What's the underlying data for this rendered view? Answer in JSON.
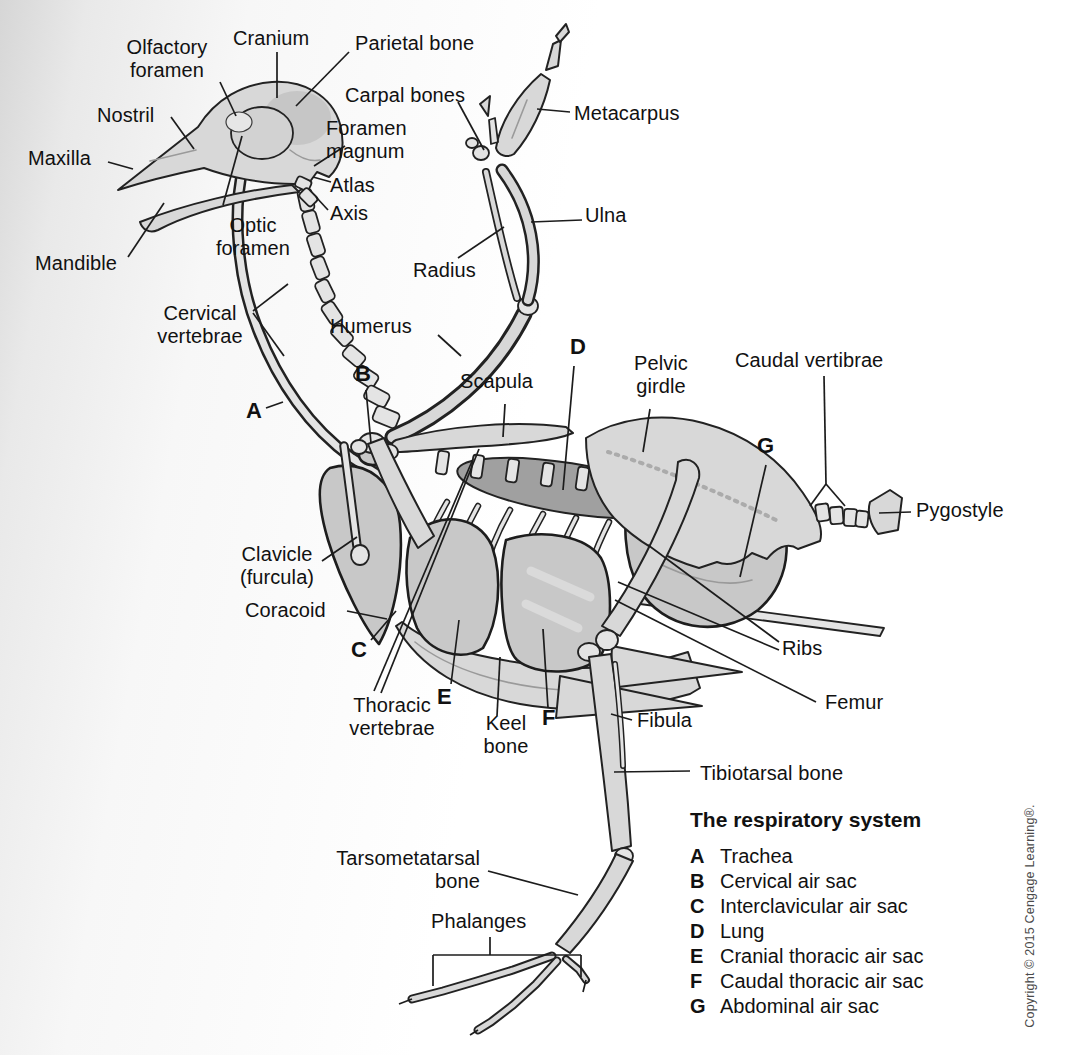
{
  "colors": {
    "background_left": "#d6d6d6",
    "paper": "#ffffff",
    "bone": "#d8d8d8",
    "bone_light": "#e4e4e4",
    "air_sac": "#c8c8c8",
    "lung": "#a0a0a0",
    "outline": "#222222",
    "text": "#111111",
    "copyright_text": "#4a4a4a"
  },
  "labels": [
    {
      "id": "olfactory-foramen",
      "text": "Olfactory\nforamen",
      "x": 167,
      "y": 36,
      "align": "center"
    },
    {
      "id": "cranium",
      "text": "Cranium",
      "x": 233,
      "y": 27,
      "align": "left"
    },
    {
      "id": "parietal-bone",
      "text": "Parietal bone",
      "x": 355,
      "y": 32,
      "align": "left"
    },
    {
      "id": "carpal-bones",
      "text": "Carpal bones",
      "x": 345,
      "y": 84,
      "align": "left"
    },
    {
      "id": "metacarpus",
      "text": "Metacarpus",
      "x": 574,
      "y": 102,
      "align": "left"
    },
    {
      "id": "nostril",
      "text": "Nostril",
      "x": 97,
      "y": 104,
      "align": "left"
    },
    {
      "id": "foramen-magnum",
      "text": "Foramen\nmagnum",
      "x": 326,
      "y": 117,
      "align": "left"
    },
    {
      "id": "maxilla",
      "text": "Maxilla",
      "x": 28,
      "y": 147,
      "align": "left"
    },
    {
      "id": "atlas",
      "text": "Atlas",
      "x": 330,
      "y": 174,
      "align": "left"
    },
    {
      "id": "axis",
      "text": "Axis",
      "x": 330,
      "y": 202,
      "align": "left"
    },
    {
      "id": "optic-foramen",
      "text": "Optic\nforamen",
      "x": 253,
      "y": 214,
      "align": "center"
    },
    {
      "id": "mandible",
      "text": "Mandible",
      "x": 35,
      "y": 252,
      "align": "left"
    },
    {
      "id": "ulna",
      "text": "Ulna",
      "x": 585,
      "y": 204,
      "align": "left"
    },
    {
      "id": "radius",
      "text": "Radius",
      "x": 413,
      "y": 259,
      "align": "left"
    },
    {
      "id": "cervical-vertebrae",
      "text": "Cervical\nvertebrae",
      "x": 200,
      "y": 302,
      "align": "center"
    },
    {
      "id": "humerus",
      "text": "Humerus",
      "x": 330,
      "y": 315,
      "align": "left"
    },
    {
      "id": "scapula",
      "text": "Scapula",
      "x": 460,
      "y": 370,
      "align": "left"
    },
    {
      "id": "pelvic-girdle",
      "text": "Pelvic\ngirdle",
      "x": 661,
      "y": 352,
      "align": "center"
    },
    {
      "id": "caudal-vertibrae",
      "text": "Caudal vertibrae",
      "x": 735,
      "y": 349,
      "align": "left"
    },
    {
      "id": "pygostyle",
      "text": "Pygostyle",
      "x": 916,
      "y": 499,
      "align": "left"
    },
    {
      "id": "clavicle-furcula",
      "text": "Clavicle\n(furcula)",
      "x": 277,
      "y": 543,
      "align": "center"
    },
    {
      "id": "coracoid",
      "text": "Coracoid",
      "x": 245,
      "y": 599,
      "align": "left"
    },
    {
      "id": "thoracic-vertebrae",
      "text": "Thoracic\nvertebrae",
      "x": 392,
      "y": 694,
      "align": "center"
    },
    {
      "id": "keel-bone",
      "text": "Keel\nbone",
      "x": 506,
      "y": 712,
      "align": "center"
    },
    {
      "id": "ribs",
      "text": "Ribs",
      "x": 782,
      "y": 637,
      "align": "left"
    },
    {
      "id": "femur",
      "text": "Femur",
      "x": 825,
      "y": 691,
      "align": "left"
    },
    {
      "id": "fibula",
      "text": "Fibula",
      "x": 637,
      "y": 709,
      "align": "left"
    },
    {
      "id": "tibiotarsal-bone",
      "text": "Tibiotarsal bone",
      "x": 700,
      "y": 762,
      "align": "left"
    },
    {
      "id": "tarsometatarsal-bone",
      "text": "Tarsometatarsal\nbone",
      "x": 480,
      "y": 847,
      "align": "right"
    },
    {
      "id": "phalanges",
      "text": "Phalanges",
      "x": 431,
      "y": 910,
      "align": "left"
    }
  ],
  "markers": [
    {
      "letter": "A",
      "x": 246,
      "y": 400
    },
    {
      "letter": "B",
      "x": 355,
      "y": 363
    },
    {
      "letter": "C",
      "x": 351,
      "y": 639
    },
    {
      "letter": "D",
      "x": 570,
      "y": 336
    },
    {
      "letter": "E",
      "x": 437,
      "y": 686
    },
    {
      "letter": "F",
      "x": 542,
      "y": 707
    },
    {
      "letter": "G",
      "x": 757,
      "y": 435
    }
  ],
  "legend": {
    "title": "The respiratory system",
    "items": [
      {
        "key": "A",
        "label": "Trachea"
      },
      {
        "key": "B",
        "label": "Cervical air sac"
      },
      {
        "key": "C",
        "label": "Interclavicular air sac"
      },
      {
        "key": "D",
        "label": "Lung"
      },
      {
        "key": "E",
        "label": "Cranial thoracic air sac"
      },
      {
        "key": "F",
        "label": "Caudal thoracic air sac"
      },
      {
        "key": "G",
        "label": "Abdominal air sac"
      }
    ]
  },
  "copyright": "Copyright © 2015 Cengage Learning®."
}
